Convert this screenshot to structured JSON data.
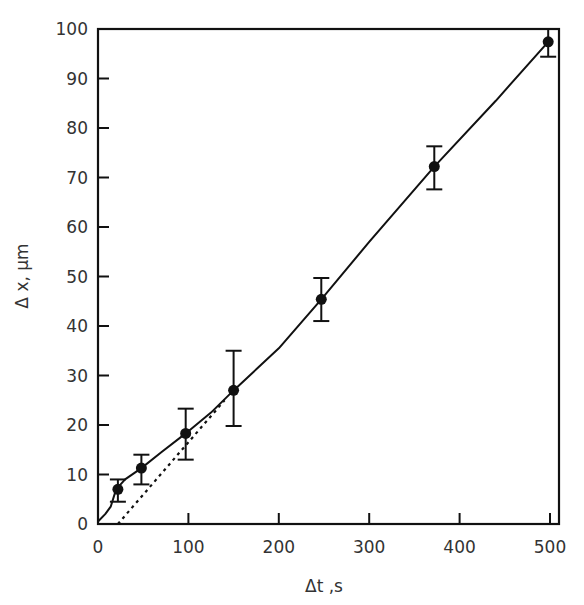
{
  "chart_data": {
    "type": "scatter",
    "title": "",
    "xlabel": "Δt ,s",
    "ylabel": "Δ x, μm",
    "xlim": [
      0,
      510
    ],
    "ylim": [
      0,
      100
    ],
    "xticks": [
      0,
      100,
      200,
      300,
      400,
      500
    ],
    "yticks": [
      0,
      10,
      20,
      30,
      40,
      50,
      60,
      70,
      80,
      90,
      100
    ],
    "grid": false,
    "legend": null,
    "series": [
      {
        "name": "measured",
        "style": "filled-circle-with-error-bars",
        "points": [
          {
            "x": 22,
            "y": 7.0,
            "ylow": 4.5,
            "yhigh": 9.0
          },
          {
            "x": 48,
            "y": 11.3,
            "ylow": 8.0,
            "yhigh": 14.0
          },
          {
            "x": 97,
            "y": 18.3,
            "ylow": 13.0,
            "yhigh": 23.3
          },
          {
            "x": 150,
            "y": 27.0,
            "ylow": 19.8,
            "yhigh": 35.0
          },
          {
            "x": 247,
            "y": 45.4,
            "ylow": 41.0,
            "yhigh": 49.7
          },
          {
            "x": 372,
            "y": 72.2,
            "ylow": 67.6,
            "yhigh": 76.3
          },
          {
            "x": 498,
            "y": 97.4,
            "ylow": 94.4,
            "yhigh": 100.0
          }
        ]
      },
      {
        "name": "fit-curve",
        "style": "solid-line",
        "points": [
          {
            "x": 0,
            "y": 0.5
          },
          {
            "x": 8,
            "y": 2
          },
          {
            "x": 14,
            "y": 3.5
          },
          {
            "x": 20,
            "y": 7
          },
          {
            "x": 30,
            "y": 9
          },
          {
            "x": 48,
            "y": 11.3
          },
          {
            "x": 70,
            "y": 14.5
          },
          {
            "x": 97,
            "y": 18.3
          },
          {
            "x": 125,
            "y": 22.5
          },
          {
            "x": 150,
            "y": 27
          },
          {
            "x": 200,
            "y": 35.5
          },
          {
            "x": 247,
            "y": 45.4
          },
          {
            "x": 300,
            "y": 57
          },
          {
            "x": 372,
            "y": 72.2
          },
          {
            "x": 440,
            "y": 85.5
          },
          {
            "x": 498,
            "y": 97.4
          }
        ]
      },
      {
        "name": "linear-extrapolation",
        "style": "dotted-line",
        "points": [
          {
            "x": 22,
            "y": 0
          },
          {
            "x": 140,
            "y": 25
          }
        ]
      }
    ]
  }
}
